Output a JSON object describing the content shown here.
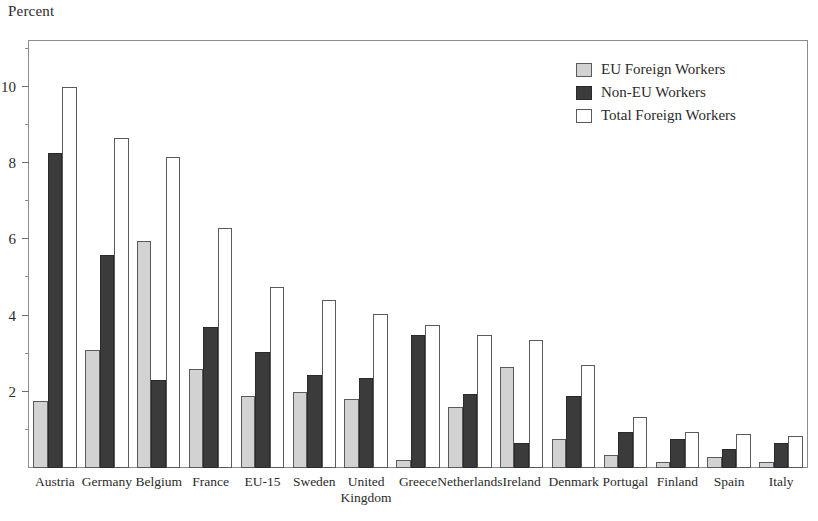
{
  "chart_data": {
    "type": "bar",
    "title": "",
    "ylabel": "Percent",
    "xlabel": "",
    "ylim": [
      0,
      11.2
    ],
    "yticks": [
      2,
      4,
      6,
      8,
      10
    ],
    "ytick_labels": [
      "2",
      "4",
      "6",
      "8",
      "10"
    ],
    "yminor_step": 1,
    "grid": false,
    "legend_position": "top-right",
    "categories": [
      "Austria",
      "Germany",
      "Belgium",
      "France",
      "EU-15",
      "Sweden",
      "United Kingdom",
      "Greece",
      "Netherlands",
      "Ireland",
      "Denmark",
      "Portugal",
      "Finland",
      "Spain",
      "Italy"
    ],
    "category_lines": [
      [
        "Austria"
      ],
      [
        "Germany"
      ],
      [
        "Belgium"
      ],
      [
        "France"
      ],
      [
        "EU-15"
      ],
      [
        "Sweden"
      ],
      [
        "United",
        "Kingdom"
      ],
      [
        "Greece"
      ],
      [
        "Netherlands"
      ],
      [
        "Ireland"
      ],
      [
        "Denmark"
      ],
      [
        "Portugal"
      ],
      [
        "Finland"
      ],
      [
        "Spain"
      ],
      [
        "Italy"
      ]
    ],
    "series": [
      {
        "name": "EU Foreign Workers",
        "color": "#d2d2d2",
        "values": [
          1.75,
          3.1,
          5.95,
          2.6,
          1.9,
          2.0,
          1.8,
          0.2,
          1.6,
          2.65,
          0.75,
          0.35,
          0.15,
          0.3,
          0.15
        ]
      },
      {
        "name": "Non-EU Workers",
        "color": "#3b3b3b",
        "values": [
          8.25,
          5.6,
          2.3,
          3.7,
          3.05,
          2.45,
          2.35,
          3.5,
          1.95,
          0.65,
          1.9,
          0.95,
          0.75,
          0.5,
          0.65
        ]
      },
      {
        "name": "Total Foreign Workers",
        "color": "#ffffff",
        "values": [
          10.0,
          8.65,
          8.15,
          6.3,
          4.75,
          4.4,
          4.05,
          3.75,
          3.5,
          3.35,
          2.7,
          1.35,
          0.95,
          0.9,
          0.85
        ]
      }
    ]
  },
  "legend": {
    "items": [
      {
        "label": "EU Foreign Workers",
        "key": "eu"
      },
      {
        "label": "Non-EU Workers",
        "key": "noneu"
      },
      {
        "label": "Total Foreign Workers",
        "key": "total"
      }
    ]
  }
}
